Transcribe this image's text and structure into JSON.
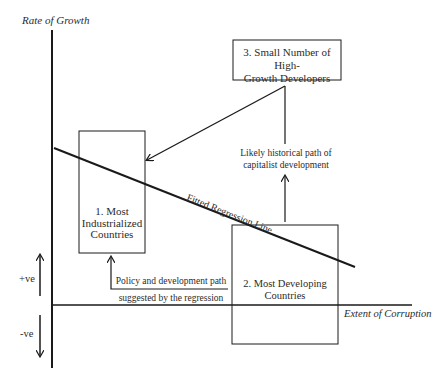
{
  "diagram": {
    "axes": {
      "y_label": "Rate of Growth",
      "x_label": "Extent of Corruption",
      "positive_label": "+ve",
      "negative_label": "-ve"
    },
    "boxes": [
      {
        "id": "box1",
        "line1": "1. Most",
        "line2": "Industrialized",
        "line3": "Countries"
      },
      {
        "id": "box2",
        "line1": "2. Most Developing",
        "line2": "Countries"
      },
      {
        "id": "box3",
        "line1": "3. Small Number of High-",
        "line2": "Growth Developers"
      }
    ],
    "annotations": {
      "regression_line": "Fitted Regression Line",
      "historical_path_line1": "Likely historical path of",
      "historical_path_line2": "capitalist development",
      "policy_path_line1": "Policy and development path",
      "policy_path_line2": "suggested by the regression"
    },
    "colors": {
      "line": "#1a1a1a",
      "background": "#ffffff"
    }
  }
}
